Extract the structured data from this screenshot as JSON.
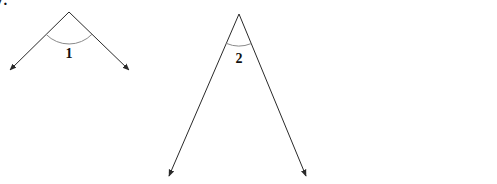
{
  "problem_number": "7.",
  "colors": {
    "ray": "#2a2a2a",
    "arc": "#8a8a8a",
    "label": "#111111"
  },
  "angles": [
    {
      "label": "1",
      "vertex": [
        69,
        12
      ],
      "ray_ends": [
        [
          10,
          70
        ],
        [
          129,
          70
        ]
      ],
      "arc_radius": 32,
      "label_pos": [
        69,
        58
      ]
    },
    {
      "label": "2",
      "vertex": [
        239,
        14
      ],
      "ray_ends": [
        [
          169,
          176
        ],
        [
          306,
          176
        ]
      ],
      "arc_radius": 32,
      "label_pos": [
        239,
        63
      ]
    }
  ]
}
